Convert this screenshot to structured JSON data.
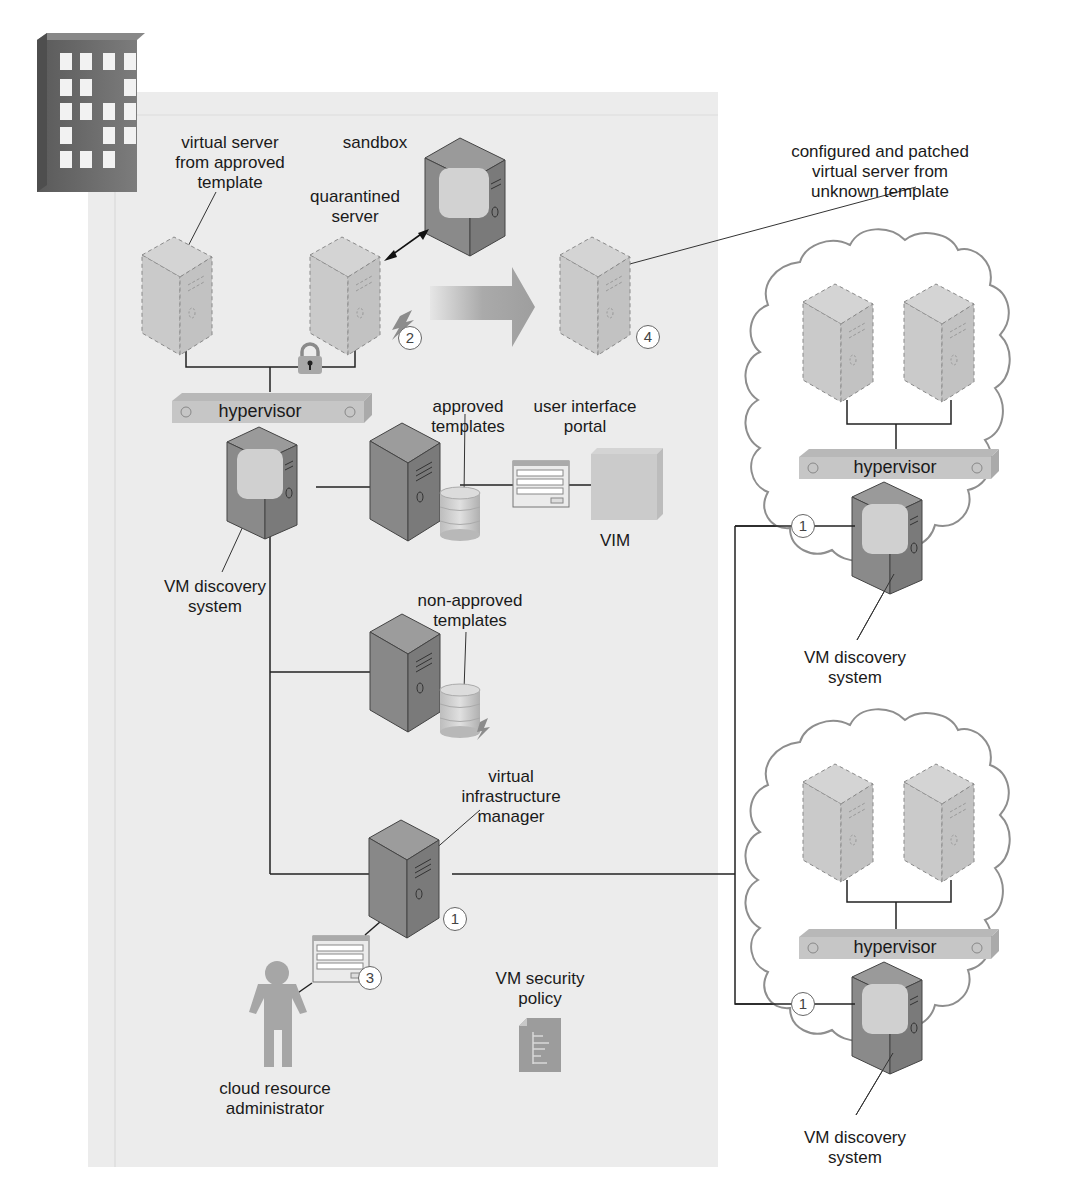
{
  "diagram": {
    "type": "cloud-architecture",
    "background_panel_color": "#ececec",
    "colors": {
      "physical_server": "#8a8a8a",
      "virtual_server": "#cfcfcf",
      "hypervisor": "#c4c4c4",
      "cloud_outline": "#9a9a9a",
      "connector": "#222222"
    }
  },
  "labels": {
    "virtual_server_approved": [
      "virtual server",
      "from approved",
      "template"
    ],
    "sandbox": "sandbox",
    "quarantined_server": [
      "quarantined",
      "server"
    ],
    "configured_patched": [
      "configured and patched",
      "virtual server from",
      "unknown template"
    ],
    "hypervisor_main": "hypervisor",
    "approved_templates": [
      "approved",
      "templates"
    ],
    "user_interface_portal": [
      "user interface",
      "portal"
    ],
    "vim": "VIM",
    "vm_discovery_main": [
      "VM discovery",
      "system"
    ],
    "non_approved_templates": [
      "non-approved",
      "templates"
    ],
    "virtual_infrastructure_manager": [
      "virtual",
      "infrastructure",
      "manager"
    ],
    "vm_security_policy": [
      "VM security",
      "policy"
    ],
    "cloud_resource_administrator": [
      "cloud resource",
      "administrator"
    ],
    "hypervisor_cloud_1": "hypervisor",
    "hypervisor_cloud_2": "hypervisor",
    "vm_discovery_cloud_1": [
      "VM discovery",
      "system"
    ],
    "vm_discovery_cloud_2": [
      "VM discovery",
      "system"
    ]
  },
  "badges": {
    "quarantined": "2",
    "patched_server": "4",
    "vim_manager": "1",
    "admin_portal": "3",
    "cloud_1": "1",
    "cloud_2": "1"
  }
}
